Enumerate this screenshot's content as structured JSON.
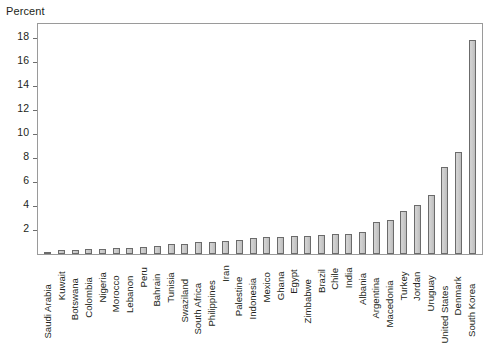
{
  "chart_data": {
    "type": "bar",
    "title": "",
    "ylabel": "Percent",
    "xlabel": "",
    "ylim": [
      0,
      19.2
    ],
    "yticks": [
      2,
      4,
      6,
      8,
      10,
      12,
      14,
      16,
      18
    ],
    "grid": false,
    "legend": null,
    "bar_color": "#cccccc",
    "bar_edge_color": "#6b6b6b",
    "categories": [
      "Saudi Arabia",
      "Kuwait",
      "Botswana",
      "Colombia",
      "Nigeria",
      "Morocco",
      "Lebanon",
      "Peru",
      "Bahrain",
      "Tunisia",
      "Swaziland",
      "South Africa",
      "Philippines",
      "Iran",
      "Palestine",
      "Indonesia",
      "Mexico",
      "Ghana",
      "Egypt",
      "Zimbabwe",
      "Brazil",
      "Chile",
      "India",
      "Albania",
      "Argentina",
      "Macedonia",
      "Turkey",
      "Jordan",
      "Uruguay",
      "United States",
      "Denmark",
      "South Korea"
    ],
    "values": [
      0.2,
      0.3,
      0.3,
      0.4,
      0.4,
      0.5,
      0.5,
      0.6,
      0.7,
      0.8,
      0.8,
      1.0,
      1.0,
      1.1,
      1.2,
      1.3,
      1.4,
      1.4,
      1.5,
      1.5,
      1.6,
      1.7,
      1.7,
      1.8,
      2.7,
      2.8,
      3.6,
      4.1,
      4.9,
      7.3,
      8.5,
      17.9
    ]
  }
}
